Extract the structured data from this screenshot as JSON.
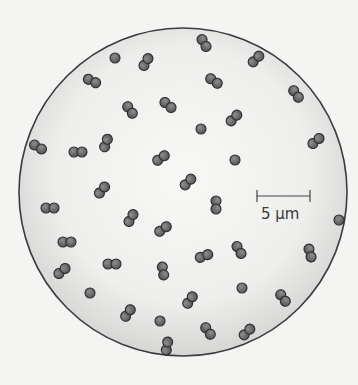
{
  "figure": {
    "scale_bar": {
      "label": "5 µm",
      "x1": 257,
      "x2": 310,
      "y": 196
    },
    "field": {
      "cx": 183,
      "cy": 192,
      "r": 164
    },
    "colors": {
      "background": "#f4f4f3",
      "field_center": "#f7f7f6",
      "field_edge": "#d8d8d8",
      "field_outline": "#3c3c3c",
      "cell_fill": "#6b6b6b",
      "cell_outline": "#2e2e2e",
      "cell_highlight": "#8a8a8a"
    },
    "cells": [
      {
        "x": 115,
        "y": 58,
        "angle": 0,
        "type": "single"
      },
      {
        "x": 146,
        "y": 62,
        "angle": -60,
        "type": "pair"
      },
      {
        "x": 204,
        "y": 43,
        "angle": 60,
        "type": "pair"
      },
      {
        "x": 256,
        "y": 59,
        "angle": -45,
        "type": "pair"
      },
      {
        "x": 92,
        "y": 81,
        "angle": 25,
        "type": "pair"
      },
      {
        "x": 214,
        "y": 81,
        "angle": 35,
        "type": "pair"
      },
      {
        "x": 296,
        "y": 94,
        "angle": 55,
        "type": "pair"
      },
      {
        "x": 130,
        "y": 110,
        "angle": 55,
        "type": "pair"
      },
      {
        "x": 168,
        "y": 105,
        "angle": 40,
        "type": "pair"
      },
      {
        "x": 234,
        "y": 118,
        "angle": -45,
        "type": "pair"
      },
      {
        "x": 201,
        "y": 129,
        "angle": 0,
        "type": "single"
      },
      {
        "x": 316,
        "y": 141,
        "angle": -40,
        "type": "pair"
      },
      {
        "x": 38,
        "y": 147,
        "angle": 30,
        "type": "pair"
      },
      {
        "x": 78,
        "y": 152,
        "angle": 0,
        "type": "pair"
      },
      {
        "x": 106,
        "y": 143,
        "angle": -70,
        "type": "pair"
      },
      {
        "x": 161,
        "y": 158,
        "angle": -35,
        "type": "pair"
      },
      {
        "x": 235,
        "y": 160,
        "angle": 0,
        "type": "single"
      },
      {
        "x": 102,
        "y": 190,
        "angle": -50,
        "type": "pair"
      },
      {
        "x": 188,
        "y": 182,
        "angle": -45,
        "type": "pair"
      },
      {
        "x": 216,
        "y": 205,
        "angle": 90,
        "type": "pair"
      },
      {
        "x": 50,
        "y": 208,
        "angle": 0,
        "type": "pair"
      },
      {
        "x": 131,
        "y": 218,
        "angle": -60,
        "type": "pair"
      },
      {
        "x": 163,
        "y": 229,
        "angle": -35,
        "type": "pair"
      },
      {
        "x": 339,
        "y": 220,
        "angle": 0,
        "type": "single"
      },
      {
        "x": 67,
        "y": 242,
        "angle": 0,
        "type": "pair"
      },
      {
        "x": 239,
        "y": 250,
        "angle": 60,
        "type": "pair"
      },
      {
        "x": 310,
        "y": 253,
        "angle": 75,
        "type": "pair"
      },
      {
        "x": 204,
        "y": 256,
        "angle": -20,
        "type": "pair"
      },
      {
        "x": 62,
        "y": 271,
        "angle": -40,
        "type": "pair"
      },
      {
        "x": 112,
        "y": 264,
        "angle": 0,
        "type": "pair"
      },
      {
        "x": 163,
        "y": 271,
        "angle": 80,
        "type": "pair"
      },
      {
        "x": 90,
        "y": 293,
        "angle": 0,
        "type": "single"
      },
      {
        "x": 242,
        "y": 288,
        "angle": 0,
        "type": "single"
      },
      {
        "x": 190,
        "y": 300,
        "angle": -55,
        "type": "pair"
      },
      {
        "x": 283,
        "y": 298,
        "angle": 55,
        "type": "pair"
      },
      {
        "x": 128,
        "y": 313,
        "angle": -55,
        "type": "pair"
      },
      {
        "x": 160,
        "y": 321,
        "angle": 0,
        "type": "single"
      },
      {
        "x": 208,
        "y": 331,
        "angle": 55,
        "type": "pair"
      },
      {
        "x": 247,
        "y": 332,
        "angle": -45,
        "type": "pair"
      },
      {
        "x": 167,
        "y": 346,
        "angle": -80,
        "type": "pair"
      }
    ]
  }
}
